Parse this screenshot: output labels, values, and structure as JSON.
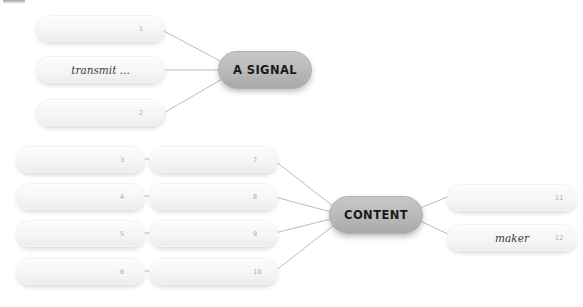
{
  "diagram": {
    "type": "mind-map",
    "title_fragment": "",
    "background_color": "#ffffff",
    "hub_color": "#bcbcbc",
    "leaf_color": "#f6f6f6",
    "edge_color": "#b4b4b4",
    "hubs": [
      {
        "id": "a-signal",
        "label": "A SIGNAL",
        "x": 218,
        "y": 51,
        "w": 94,
        "h": 38
      },
      {
        "id": "content",
        "label": "CONTENT",
        "x": 329,
        "y": 196,
        "w": 94,
        "h": 38
      }
    ],
    "leaves": [
      {
        "id": "leaf-1",
        "number": "1",
        "text": "",
        "x": 36,
        "y": 15,
        "w": 129,
        "h": 27,
        "num_x": 0.79
      },
      {
        "id": "leaf-2",
        "number": "",
        "text": "transmit ...",
        "x": 36,
        "y": 56,
        "w": 129,
        "h": 27,
        "num_x": 0.5
      },
      {
        "id": "leaf-3",
        "number": "2",
        "text": "",
        "x": 36,
        "y": 99,
        "w": 129,
        "h": 27,
        "num_x": 0.79
      },
      {
        "id": "leaf-4",
        "number": "3",
        "text": "",
        "x": 16,
        "y": 146,
        "w": 129,
        "h": 27,
        "num_x": 0.8
      },
      {
        "id": "leaf-5",
        "number": "4",
        "text": "",
        "x": 16,
        "y": 183,
        "w": 129,
        "h": 27,
        "num_x": 0.8
      },
      {
        "id": "leaf-6",
        "number": "5",
        "text": "",
        "x": 16,
        "y": 220,
        "w": 129,
        "h": 27,
        "num_x": 0.8
      },
      {
        "id": "leaf-7",
        "number": "6",
        "text": "",
        "x": 16,
        "y": 258,
        "w": 129,
        "h": 27,
        "num_x": 0.8
      },
      {
        "id": "leaf-8",
        "number": "7",
        "text": "",
        "x": 149,
        "y": 146,
        "w": 129,
        "h": 27,
        "num_x": 0.8
      },
      {
        "id": "leaf-9",
        "number": "8",
        "text": "",
        "x": 149,
        "y": 183,
        "w": 129,
        "h": 27,
        "num_x": 0.8
      },
      {
        "id": "leaf-10",
        "number": "9",
        "text": "",
        "x": 149,
        "y": 220,
        "w": 129,
        "h": 27,
        "num_x": 0.8
      },
      {
        "id": "leaf-11",
        "number": "10",
        "text": "",
        "x": 149,
        "y": 258,
        "w": 129,
        "h": 27,
        "num_x": 0.8
      },
      {
        "id": "leaf-12",
        "number": "11",
        "text": "",
        "x": 447,
        "y": 184,
        "w": 130,
        "h": 27,
        "num_x": 0.82
      },
      {
        "id": "leaf-13",
        "number": "12",
        "text": "maker",
        "x": 447,
        "y": 224,
        "w": 130,
        "h": 27,
        "num_x": 0.82
      }
    ],
    "edges": [
      {
        "from": "leaf-1",
        "to": "a-signal",
        "x1": 162,
        "y1": 30,
        "x2": 222,
        "y2": 62
      },
      {
        "from": "leaf-2",
        "to": "a-signal",
        "x1": 162,
        "y1": 70,
        "x2": 220,
        "y2": 70
      },
      {
        "from": "leaf-3",
        "to": "a-signal",
        "x1": 162,
        "y1": 114,
        "x2": 222,
        "y2": 79
      },
      {
        "from": "leaf-4",
        "to": "leaf-8",
        "x1": 143,
        "y1": 159,
        "x2": 152,
        "y2": 159
      },
      {
        "from": "leaf-5",
        "to": "leaf-9",
        "x1": 143,
        "y1": 196,
        "x2": 152,
        "y2": 196
      },
      {
        "from": "leaf-6",
        "to": "leaf-10",
        "x1": 143,
        "y1": 233,
        "x2": 152,
        "y2": 233
      },
      {
        "from": "leaf-7",
        "to": "leaf-11",
        "x1": 143,
        "y1": 271,
        "x2": 152,
        "y2": 271
      },
      {
        "from": "leaf-8",
        "to": "content",
        "x1": 275,
        "y1": 161,
        "x2": 333,
        "y2": 206
      },
      {
        "from": "leaf-9",
        "to": "content",
        "x1": 275,
        "y1": 197,
        "x2": 331,
        "y2": 212
      },
      {
        "from": "leaf-10",
        "to": "content",
        "x1": 275,
        "y1": 233,
        "x2": 331,
        "y2": 219
      },
      {
        "from": "leaf-11",
        "to": "content",
        "x1": 275,
        "y1": 271,
        "x2": 333,
        "y2": 226
      },
      {
        "from": "content",
        "to": "leaf-12",
        "x1": 420,
        "y1": 208,
        "x2": 450,
        "y2": 196
      },
      {
        "from": "content",
        "to": "leaf-13",
        "x1": 420,
        "y1": 221,
        "x2": 450,
        "y2": 235
      }
    ]
  }
}
